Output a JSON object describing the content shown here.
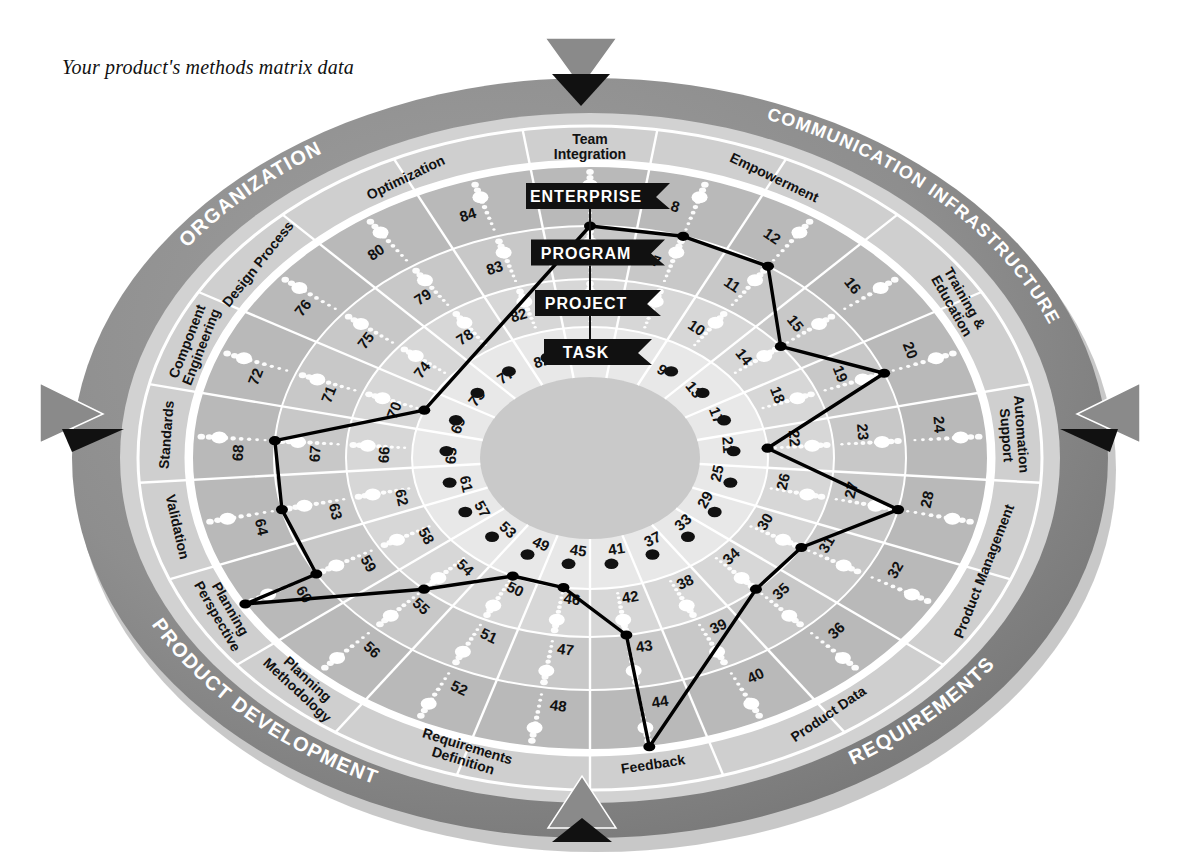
{
  "title": "Your product's methods matrix data",
  "wheel": {
    "ring_levels": [
      "ENTERPRISE",
      "PROGRAM",
      "PROJECT",
      "TASK"
    ],
    "quadrants": [
      {
        "name": "ORGANIZATION"
      },
      {
        "name": "COMMUNICATION INFRASTRUCTURE"
      },
      {
        "name": "REQUIREMENTS"
      },
      {
        "name": "PRODUCT DEVELOPMENT"
      }
    ],
    "segments": [
      {
        "label": "Team Integration",
        "numbers": [
          1,
          2,
          3,
          4
        ]
      },
      {
        "label": "Empowerment",
        "numbers": [
          5,
          6,
          7,
          8
        ]
      },
      {
        "label": "Empowerment",
        "numbers": [
          9,
          10,
          11,
          12
        ]
      },
      {
        "label": "Training & Education",
        "numbers": [
          13,
          14,
          15,
          16
        ]
      },
      {
        "label": "Training & Education",
        "numbers": [
          17,
          18,
          19,
          20
        ]
      },
      {
        "label": "Automation Support",
        "numbers": [
          21,
          22,
          23,
          24
        ]
      },
      {
        "label": "Product Management",
        "numbers": [
          25,
          26,
          27,
          28
        ]
      },
      {
        "label": "Product Management",
        "numbers": [
          29,
          30,
          31,
          32
        ]
      },
      {
        "label": "Product Data",
        "numbers": [
          33,
          34,
          35,
          36
        ]
      },
      {
        "label": "Product Data",
        "numbers": [
          37,
          38,
          39,
          40
        ]
      },
      {
        "label": "Feedback",
        "numbers": [
          41,
          42,
          43,
          44
        ]
      },
      {
        "label": "Requirements Definition",
        "numbers": [
          45,
          46,
          47,
          48
        ]
      },
      {
        "label": "Requirements Definition",
        "numbers": [
          49,
          50,
          51,
          52
        ]
      },
      {
        "label": "Planning Methodology",
        "numbers": [
          53,
          54,
          55,
          56
        ]
      },
      {
        "label": "Planning Perspective",
        "numbers": [
          57,
          58,
          59,
          60
        ]
      },
      {
        "label": "Validation",
        "numbers": [
          61,
          62,
          63,
          64
        ]
      },
      {
        "label": "Standards",
        "numbers": [
          65,
          66,
          67,
          68
        ]
      },
      {
        "label": "Component Engineering",
        "numbers": [
          69,
          70,
          71,
          72
        ]
      },
      {
        "label": "Design Process",
        "numbers": [
          73,
          74,
          75,
          76
        ]
      },
      {
        "label": "Optimization",
        "numbers": [
          77,
          78,
          79,
          80
        ]
      },
      {
        "label": "Optimization",
        "numbers": [
          81,
          82,
          83,
          84
        ]
      }
    ]
  },
  "chart_data": {
    "type": "radar",
    "title": "Your product's methods matrix data",
    "rings": [
      "TASK",
      "PROJECT",
      "PROGRAM",
      "ENTERPRISE"
    ],
    "spoke_count": 21,
    "series": [
      {
        "name": "Your product",
        "vertices": [
          {
            "marker": 20,
            "level": 3
          },
          {
            "marker": 23,
            "level": 1
          },
          {
            "marker": 28,
            "level": 3
          },
          {
            "marker": 32,
            "level": 2
          },
          {
            "marker": 36,
            "level": 2
          },
          {
            "marker": 41,
            "level": 4
          },
          {
            "marker": 44,
            "level": 2
          },
          {
            "marker": 47,
            "level": 1
          },
          {
            "marker": 51,
            "level": 1
          },
          {
            "marker": 56,
            "level": 2
          },
          {
            "marker": 57,
            "level": 4
          },
          {
            "marker": 60,
            "level": 3
          },
          {
            "marker": 64,
            "level": 3
          },
          {
            "marker": 68,
            "level": 3
          },
          {
            "marker": 71,
            "level": 1
          },
          {
            "marker": 2,
            "level": 3
          },
          {
            "marker": 6,
            "level": 3
          },
          {
            "marker": 10,
            "level": 3
          },
          {
            "marker": 15,
            "level": 2
          }
        ]
      }
    ],
    "xlabel": "",
    "ylabel": "",
    "grid": true,
    "legend": "none"
  },
  "colors": {
    "rim_outer": "#8c8c8c",
    "rim_label_band": "#9a9a9a",
    "ring_enterprise": "#b9b9b9",
    "ring_program": "#c8c8c8",
    "ring_project": "#d6d6d6",
    "ring_task": "#e6e6e6",
    "hub": "#c9c9c9",
    "data_line": "#000000",
    "dot_light": "#ffffff",
    "dot_dark": "#111111"
  },
  "markers": {
    "arrow_top": "triangle-down-marker",
    "arrow_left": "triangle-right-marker",
    "arrow_right": "triangle-left-marker",
    "arrow_bottom": "triangle-up-marker"
  }
}
